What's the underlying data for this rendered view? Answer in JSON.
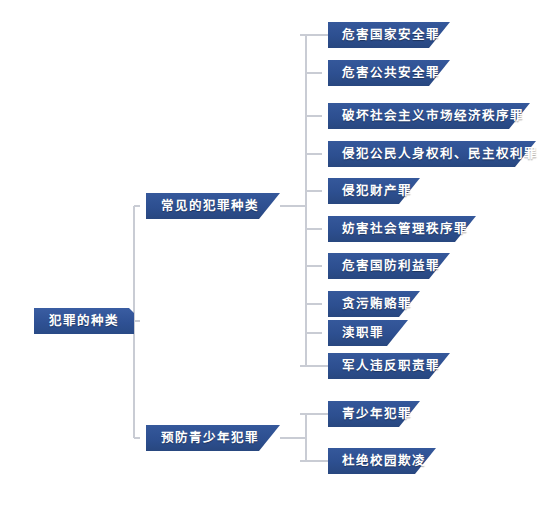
{
  "diagram": {
    "title": "犯罪的种类",
    "type": "mindmap-tree",
    "colors": {
      "node_fill": "#2E5193",
      "node_text": "#FFFFFF",
      "connector": "#C9CCD4",
      "shadow": "#B9BCC4",
      "background": "#FFFFFF"
    },
    "root": {
      "label": "犯罪的种类",
      "x": 34,
      "y": 308,
      "w": 100,
      "h": 26
    },
    "branches": [
      {
        "label": "常见的犯罪种类",
        "x": 146,
        "y": 193,
        "w": 134,
        "h": 26,
        "children": [
          {
            "label": "危害国家安全罪",
            "x": 328,
            "y": 22,
            "w": 122,
            "h": 26
          },
          {
            "label": "危害公共安全罪",
            "x": 328,
            "y": 60,
            "w": 122,
            "h": 26
          },
          {
            "label": "破坏社会主义市场经济秩序罪",
            "x": 328,
            "y": 103,
            "w": 202,
            "h": 26
          },
          {
            "label": "侵犯公民人身权利、民主权利罪",
            "x": 328,
            "y": 141,
            "w": 208,
            "h": 26
          },
          {
            "label": "侵犯财产罪",
            "x": 328,
            "y": 178,
            "w": 92,
            "h": 26
          },
          {
            "label": "妨害社会管理秩序罪",
            "x": 328,
            "y": 216,
            "w": 148,
            "h": 26
          },
          {
            "label": "危害国防利益罪",
            "x": 328,
            "y": 253,
            "w": 122,
            "h": 26
          },
          {
            "label": "贪污贿赂罪",
            "x": 328,
            "y": 291,
            "w": 92,
            "h": 26
          },
          {
            "label": "渎职罪",
            "x": 328,
            "y": 320,
            "w": 80,
            "h": 26
          },
          {
            "label": "军人违反职责罪",
            "x": 328,
            "y": 353,
            "w": 122,
            "h": 26
          }
        ]
      },
      {
        "label": "预防青少年犯罪",
        "x": 146,
        "y": 425,
        "w": 134,
        "h": 26,
        "children": [
          {
            "label": "青少年犯罪",
            "x": 328,
            "y": 401,
            "w": 92,
            "h": 26
          },
          {
            "label": "杜绝校园欺凌",
            "x": 328,
            "y": 448,
            "w": 108,
            "h": 26
          }
        ]
      }
    ]
  }
}
